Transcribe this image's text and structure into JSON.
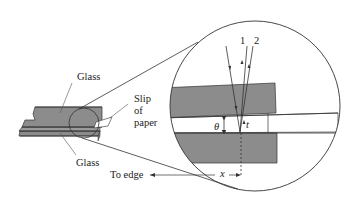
{
  "diagram": {
    "type": "physics-illustration",
    "labels": {
      "glass_top": "Glass",
      "glass_bottom": "Glass",
      "slip_line1": "Slip",
      "slip_line2": "of",
      "slip_line3": "paper",
      "to_edge": "To edge",
      "ray1": "1",
      "ray2": "2",
      "theta": "θ",
      "t": "t",
      "x": "x"
    },
    "colors": {
      "glass_fill": "#8c8c8c",
      "stroke": "#333333",
      "background": "#ffffff"
    }
  }
}
